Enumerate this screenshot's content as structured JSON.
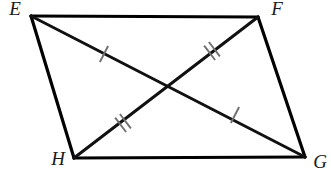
{
  "figure": {
    "name": "parallelogram-efgh-with-diagonals",
    "type": "geometry-diagram",
    "canvas": {
      "width": 331,
      "height": 173,
      "background": "#ffffff"
    },
    "stroke_color": "#000000",
    "tick_color": "#6f6f6f",
    "label_color": "#1a1a1a",
    "vertices": [
      {
        "id": "E",
        "label": "E",
        "x": 31,
        "y": 16,
        "label_x": 15,
        "label_y": 15
      },
      {
        "id": "F",
        "label": "F",
        "x": 258,
        "y": 17,
        "label_x": 277,
        "label_y": 15
      },
      {
        "id": "G",
        "label": "G",
        "x": 305,
        "y": 157,
        "label_x": 320,
        "label_y": 168
      },
      {
        "id": "H",
        "label": "H",
        "x": 74,
        "y": 158,
        "label_x": 58,
        "label_y": 165
      }
    ],
    "edges": [
      {
        "id": "EF",
        "from": "E",
        "to": "F",
        "x1": 31,
        "y1": 16,
        "x2": 258,
        "y2": 17
      },
      {
        "id": "FG",
        "from": "F",
        "to": "G",
        "x1": 258,
        "y1": 17,
        "x2": 305,
        "y2": 157
      },
      {
        "id": "GH",
        "from": "G",
        "to": "H",
        "x1": 305,
        "y1": 157,
        "x2": 74,
        "y2": 158
      },
      {
        "id": "HE",
        "from": "H",
        "to": "E",
        "x1": 74,
        "y1": 158,
        "x2": 31,
        "y2": 16
      }
    ],
    "diagonals": [
      {
        "id": "EG",
        "from": "E",
        "to": "G",
        "x1": 31,
        "y1": 16,
        "x2": 305,
        "y2": 157,
        "tick_count": 1
      },
      {
        "id": "FH",
        "from": "F",
        "to": "H",
        "x1": 258,
        "y1": 17,
        "x2": 74,
        "y2": 158,
        "tick_count": 2
      }
    ],
    "intersection": {
      "id": "P",
      "x": 172,
      "y": 87
    },
    "tick_marks": [
      {
        "id": "tick-EP",
        "segment": "EG",
        "half": "E-to-center",
        "count": 1,
        "cx": 104,
        "cy": 54,
        "angle_deg": 27.2
      },
      {
        "id": "tick-PG",
        "segment": "EG",
        "half": "center-to-G",
        "count": 1,
        "cx": 235,
        "cy": 115,
        "angle_deg": 27.2
      },
      {
        "id": "tick-FP",
        "segment": "FH",
        "half": "F-to-center",
        "count": 2,
        "cx": 212,
        "cy": 51,
        "angle_deg": 142.5
      },
      {
        "id": "tick-PH",
        "segment": "FH",
        "half": "center-to-H",
        "count": 2,
        "cx": 123,
        "cy": 123,
        "angle_deg": 142.5
      }
    ]
  }
}
